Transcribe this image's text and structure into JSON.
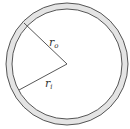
{
  "diagram": {
    "type": "annulus",
    "center": {
      "x": 67,
      "y": 64
    },
    "outer_radius": 61,
    "inner_radius": 55,
    "ring_fill": "#e4e4e4",
    "stroke_color": "#555555",
    "background": "#ffffff",
    "labels": {
      "outer": {
        "base": "r",
        "sub": "o"
      },
      "inner": {
        "base": "r",
        "sub": "i"
      }
    }
  }
}
